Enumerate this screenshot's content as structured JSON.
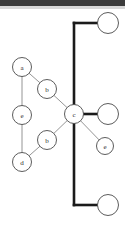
{
  "figure": {
    "title": "",
    "background_color": "#ffffff",
    "width": 125,
    "height": 228
  },
  "top_band": {
    "color": "#3b3b3b",
    "fade_color": "#d8d8d8"
  },
  "style": {
    "thin_edge_color": "#7a7a7a",
    "thin_edge_width": 0.8,
    "thick_edge_color": "#1a1a1a",
    "thick_edge_width": 2.6,
    "node_stroke_color": "#4a4a4a",
    "node_fill_color": "#ffffff",
    "node_stroke_width": 0.9,
    "label_color": "#2b2b2b"
  },
  "graph": {
    "labelled_nodes": [
      {
        "id": "n_a",
        "label": "a",
        "cx": 22,
        "cy": 67,
        "r": 9.5
      },
      {
        "id": "n_b1",
        "label": "b",
        "cx": 47,
        "cy": 89,
        "r": 9.5
      },
      {
        "id": "n_e1",
        "label": "e",
        "cx": 22,
        "cy": 115,
        "r": 9.5
      },
      {
        "id": "n_c",
        "label": "c",
        "cx": 74,
        "cy": 114,
        "r": 9.5
      },
      {
        "id": "n_b2",
        "label": "b",
        "cx": 47,
        "cy": 140,
        "r": 9.5
      },
      {
        "id": "n_d",
        "label": "d",
        "cx": 22,
        "cy": 162,
        "r": 9.5
      },
      {
        "id": "n_e2",
        "label": "e",
        "cx": 105,
        "cy": 146,
        "r": 8.5
      }
    ],
    "empty_nodes": [
      {
        "id": "n_t",
        "label": "",
        "cx": 108,
        "cy": 23,
        "r": 10.5
      },
      {
        "id": "n_m",
        "label": "",
        "cx": 108,
        "cy": 114,
        "r": 10.5
      },
      {
        "id": "n_b",
        "label": "",
        "cx": 108,
        "cy": 205,
        "r": 10.5
      }
    ],
    "thin_edges": [
      {
        "from": "n_a",
        "to": "n_b1"
      },
      {
        "from": "n_a",
        "to": "n_e1"
      },
      {
        "from": "n_b1",
        "to": "n_c"
      },
      {
        "from": "n_e1",
        "to": "n_d"
      },
      {
        "from": "n_d",
        "to": "n_b2"
      },
      {
        "from": "n_b2",
        "to": "n_c"
      },
      {
        "from": "n_c",
        "to": "n_e2"
      }
    ],
    "thick_trunk": {
      "x": 74,
      "y_top": 23,
      "y_bottom": 205,
      "branches": [
        {
          "y": 23,
          "x_end": 97
        },
        {
          "y": 114,
          "x_end": 97
        },
        {
          "y": 205,
          "x_end": 97
        }
      ]
    }
  }
}
